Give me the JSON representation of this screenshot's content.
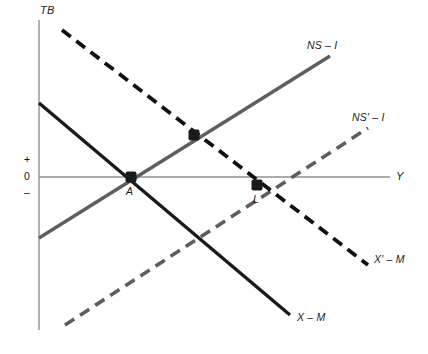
{
  "figure": {
    "background_color": "#ffffff"
  },
  "axes": {
    "vertical_label": "TB",
    "horizontal_label": "Y",
    "tick_labels": {
      "positive": "+",
      "zero": "0",
      "negative": "–"
    },
    "axis_color": "#808080"
  },
  "curve_labels": {
    "ns_i": "NS – I",
    "ns_prime_i": "NS′ – I",
    "x_m": "X – M",
    "x_prime_m": "X′ – M"
  },
  "point_labels": {
    "a": "A",
    "l": "L"
  },
  "colors": {
    "solid_black": "#1a1a1a",
    "solid_gray": "#5e5e5e",
    "dashed_black": "#111111",
    "dashed_gray": "#5e5e5e",
    "axis": "#909090",
    "marker": "#1a1a1a"
  },
  "chart_data": {
    "type": "line",
    "title": "",
    "xlabel": "Y",
    "ylabel": "TB",
    "grid": false,
    "legend": "inline-curve-labels",
    "axis_origin_px": {
      "x": 39,
      "y": 177
    },
    "xlim_px": [
      39,
      390
    ],
    "ylim_px": [
      20,
      330
    ],
    "series": [
      {
        "name": "X – M",
        "style": "solid",
        "color": "#1a1a1a",
        "slope": "negative",
        "points_px": [
          [
            39,
            103
          ],
          [
            290,
            315
          ]
        ],
        "label_px": [
          296,
          318
        ]
      },
      {
        "name": "X′ – M",
        "style": "dashed",
        "color": "#111111",
        "slope": "negative",
        "points_px": [
          [
            62,
            30
          ],
          [
            368,
            265
          ]
        ],
        "label_px": [
          374,
          260
        ]
      },
      {
        "name": "NS – I",
        "style": "solid",
        "color": "#5e5e5e",
        "slope": "positive",
        "points_px": [
          [
            39,
            238
          ],
          [
            330,
            56
          ]
        ],
        "label_px": [
          307,
          46
        ]
      },
      {
        "name": "NS′ – I",
        "style": "dashed",
        "color": "#5e5e5e",
        "slope": "positive",
        "points_px": [
          [
            65,
            325
          ],
          [
            368,
            128
          ]
        ],
        "label_px": [
          352,
          118
        ]
      }
    ],
    "points": [
      {
        "name": "A",
        "px": [
          131,
          177
        ],
        "label_px": [
          127,
          190
        ],
        "description": "Intersection of X – M and NS – I on the zero line"
      },
      {
        "name": "",
        "px": [
          194,
          135
        ],
        "label_px": null,
        "description": "Intersection of X′ – M and NS – I (unlabeled)"
      },
      {
        "name": "L",
        "px": [
          257,
          185
        ],
        "label_px": [
          254,
          198
        ],
        "description": "Intersection of X′ – M and NS′ – I below the zero line"
      }
    ]
  }
}
